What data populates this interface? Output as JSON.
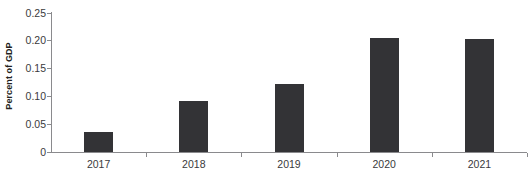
{
  "chart_data": {
    "type": "bar",
    "title": "",
    "subtitle": "",
    "xlabel": "",
    "ylabel": "Percent of GDP",
    "categories": [
      "2017",
      "2018",
      "2019",
      "2020",
      "2021"
    ],
    "values": [
      0.035,
      0.091,
      0.122,
      0.205,
      0.202
    ],
    "series": [
      {
        "name": "Percent of GDP",
        "values": [
          0.035,
          0.091,
          0.122,
          0.205,
          0.202
        ]
      }
    ],
    "ylim": [
      0,
      0.25
    ],
    "y_ticks": [
      0,
      0.05,
      0.1,
      0.15,
      0.2,
      0.25
    ],
    "y_tick_labels": [
      "0",
      "0.05",
      "0.10",
      "0.15",
      "0.20",
      "0.25"
    ],
    "grid": false,
    "legend": "none",
    "bar_color": "#333336",
    "axis_color": "#8a8a8d",
    "text_color": "#3a3a3c",
    "background": "#ffffff",
    "annotations": []
  }
}
